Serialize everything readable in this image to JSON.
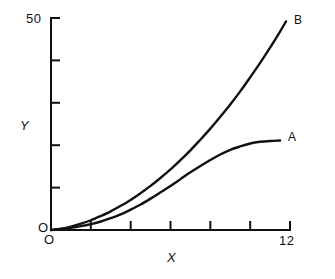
{
  "chart_data": {
    "type": "line",
    "title": "",
    "xlabel": "X",
    "ylabel": "Y",
    "xlim": [
      0,
      12
    ],
    "ylim": [
      0,
      50
    ],
    "grid": false,
    "legend": "inline-end-labels",
    "axis_style": "two-axis-open",
    "x_tick_labels": [
      "O",
      "12"
    ],
    "y_tick_labels": [
      "O",
      "50"
    ],
    "x_ticks": [
      2,
      4,
      6,
      8,
      10,
      12
    ],
    "y_ticks": [
      10,
      20,
      30,
      40,
      50
    ],
    "origin_label": "O",
    "x_max_label": "12",
    "y_max_label": "50",
    "line_color": "#000000",
    "background_color": "#ffffff",
    "series": [
      {
        "name": "A",
        "label": "A",
        "shape": "sigmoid-saturating",
        "x": [
          0,
          0.5,
          1,
          1.5,
          2,
          2.5,
          3,
          3.5,
          4,
          4.5,
          5,
          5.5,
          6,
          6.5,
          7,
          7.5,
          8,
          8.5,
          9,
          9.5,
          10,
          10.5,
          11,
          11.5
        ],
        "values": [
          0,
          0.2,
          0.5,
          0.9,
          1.4,
          2.0,
          2.8,
          3.7,
          4.8,
          6.0,
          7.4,
          8.9,
          10.4,
          12.0,
          13.6,
          15.1,
          16.5,
          17.8,
          18.9,
          19.7,
          20.4,
          20.8,
          21.0,
          21.1
        ]
      },
      {
        "name": "B",
        "label": "B",
        "shape": "convex-accelerating",
        "x": [
          0,
          0.5,
          1,
          1.5,
          2,
          2.5,
          3,
          3.5,
          4,
          4.5,
          5,
          5.5,
          6,
          6.5,
          7,
          7.5,
          8,
          8.5,
          9,
          9.5,
          10,
          10.5,
          11,
          11.5,
          11.8
        ],
        "values": [
          0,
          0.3,
          0.8,
          1.5,
          2.3,
          3.3,
          4.4,
          5.7,
          7.1,
          8.7,
          10.4,
          12.3,
          14.3,
          16.5,
          18.8,
          21.3,
          23.9,
          26.7,
          29.6,
          32.7,
          36.0,
          39.4,
          43.0,
          46.8,
          49.2
        ]
      }
    ]
  },
  "labels": {
    "y_max": "50",
    "y_origin": "O",
    "x_origin": "O",
    "x_max": "12",
    "y_axis_title": "Y",
    "x_axis_title": "X",
    "curve_a": "A",
    "curve_b": "B"
  }
}
